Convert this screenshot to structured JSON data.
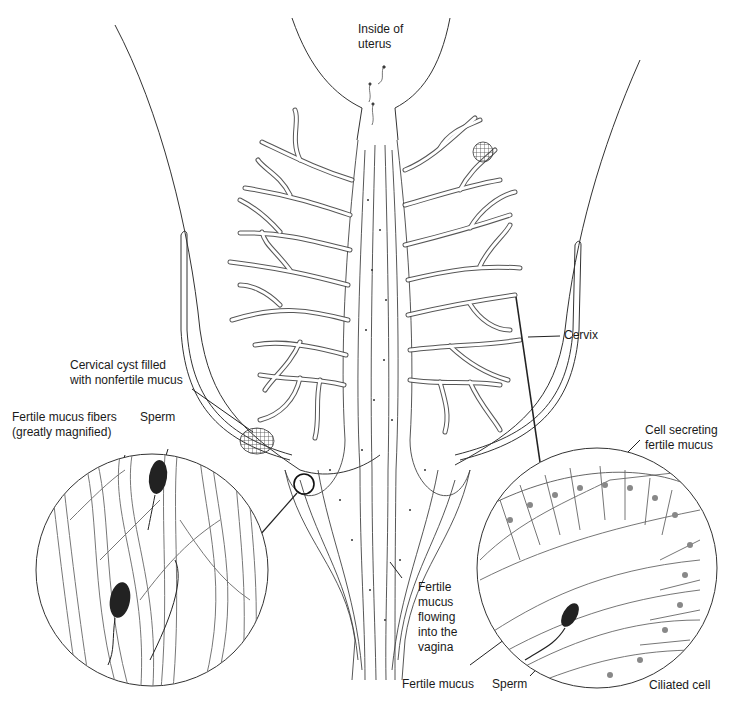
{
  "diagram": {
    "type": "anatomical illustration",
    "labels": {
      "uterus": "Inside of\nuterus",
      "cervix": "Cervix",
      "cyst": "Cervical cyst filled\nwith nonfertile mucus",
      "fibers": "Fertile mucus fibers\n(greatly magnified)",
      "sperm_left": "Sperm",
      "secreting": "Cell secreting\nfertile mucus",
      "flowing": "Fertile\nmucus\nflowing\ninto the\nvagina",
      "fertile_mucus": "Fertile mucus",
      "sperm_right": "Sperm",
      "ciliated": "Ciliated cell"
    },
    "colors": {
      "line": "#2a2a2a",
      "shade": "#9a9a9a",
      "sperm": "#222222",
      "background": "#ffffff"
    }
  }
}
